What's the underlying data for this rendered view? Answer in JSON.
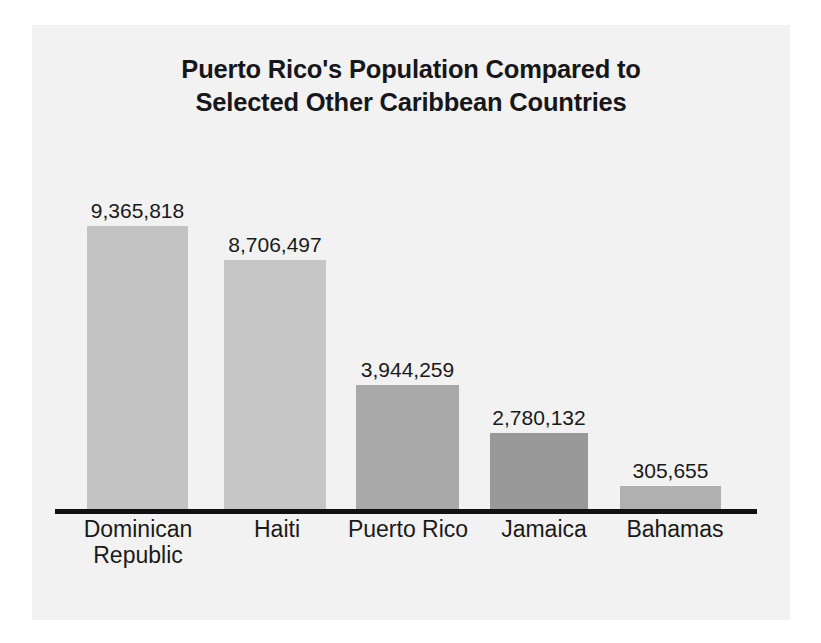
{
  "figure": {
    "background_color": "#f2f2f2",
    "canvas_color": "#ffffff"
  },
  "chart_data": {
    "type": "bar",
    "title": "Puerto Rico's Population Compared to\nSelected Other Caribbean Countries",
    "subtitle": "",
    "xlabel": "",
    "ylabel": "",
    "categories": [
      "Dominican\nRepublic",
      "Haiti",
      "Puerto Rico",
      "Jamaica",
      "Bahamas"
    ],
    "values": [
      9365818,
      8706497,
      3944259,
      2780132,
      305655
    ],
    "value_labels": [
      "9,365,818",
      "8,706,497",
      "3,944,259",
      "2,780,132",
      "305,655"
    ],
    "bar_colors": [
      "#c3c3c3",
      "#c6c6c6",
      "#a9a9a9",
      "#999999",
      "#b0b0b0"
    ],
    "ylim": [
      0,
      9365818
    ],
    "grid": false,
    "legend": null,
    "axis_color": "#111111",
    "label_color": "#1a1a1a"
  },
  "bars": [
    {
      "name": "Dominican Republic",
      "label": "Dominican\nRepublic",
      "value_label": "9,365,818",
      "value": 9365818,
      "color": "#c3c3c3",
      "left": 55,
      "width": 101,
      "height": 283
    },
    {
      "name": "Haiti",
      "label": "Haiti",
      "value_label": "8,706,497",
      "value": 8706497,
      "color": "#c6c6c6",
      "left": 192,
      "width": 102,
      "height": 249
    },
    {
      "name": "Puerto Rico",
      "label": "Puerto Rico",
      "value_label": "3,944,259",
      "value": 3944259,
      "color": "#a9a9a9",
      "left": 324,
      "width": 103,
      "height": 124
    },
    {
      "name": "Jamaica",
      "label": "Jamaica",
      "value_label": "2,780,132",
      "value": 2780132,
      "color": "#999999",
      "left": 458,
      "width": 98,
      "height": 76
    },
    {
      "name": "Bahamas",
      "label": "Bahamas",
      "value_label": "305,655",
      "value": 305655,
      "color": "#b0b0b0",
      "left": 588,
      "width": 101,
      "height": 23
    }
  ],
  "category_label_boxes": [
    {
      "left": 22,
      "width": 168
    },
    {
      "left": 190,
      "width": 110
    },
    {
      "left": 300,
      "width": 152
    },
    {
      "left": 452,
      "width": 120
    },
    {
      "left": 578,
      "width": 130
    }
  ]
}
